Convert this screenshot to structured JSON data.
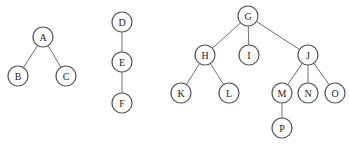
{
  "diagram": {
    "type": "forest",
    "node_radius": 10,
    "trees": [
      {
        "root": "A",
        "nodes": [
          {
            "id": "A",
            "label": "A",
            "x": 43,
            "y": 37
          },
          {
            "id": "B",
            "label": "B",
            "x": 18,
            "y": 76
          },
          {
            "id": "C",
            "label": "C",
            "x": 66,
            "y": 76
          }
        ],
        "edges": [
          [
            "A",
            "B"
          ],
          [
            "A",
            "C"
          ]
        ]
      },
      {
        "root": "D",
        "nodes": [
          {
            "id": "D",
            "label": "D",
            "x": 122,
            "y": 22
          },
          {
            "id": "E",
            "label": "E",
            "x": 122,
            "y": 62
          },
          {
            "id": "F",
            "label": "F",
            "x": 122,
            "y": 103
          }
        ],
        "edges": [
          [
            "D",
            "E"
          ],
          [
            "E",
            "F"
          ]
        ]
      },
      {
        "root": "G",
        "nodes": [
          {
            "id": "G",
            "label": "G",
            "x": 248,
            "y": 16
          },
          {
            "id": "H",
            "label": "H",
            "x": 205,
            "y": 55
          },
          {
            "id": "I",
            "label": "I",
            "x": 249,
            "y": 55
          },
          {
            "id": "J",
            "label": "J",
            "x": 308,
            "y": 55
          },
          {
            "id": "K",
            "label": "K",
            "x": 181,
            "y": 93
          },
          {
            "id": "L",
            "label": "L",
            "x": 229,
            "y": 93
          },
          {
            "id": "M",
            "label": "M",
            "x": 282,
            "y": 93
          },
          {
            "id": "N",
            "label": "N",
            "x": 308,
            "y": 93
          },
          {
            "id": "O",
            "label": "O",
            "x": 335,
            "y": 93
          },
          {
            "id": "P",
            "label": "P",
            "x": 282,
            "y": 128
          }
        ],
        "edges": [
          [
            "G",
            "H"
          ],
          [
            "G",
            "I"
          ],
          [
            "G",
            "J"
          ],
          [
            "H",
            "K"
          ],
          [
            "H",
            "L"
          ],
          [
            "J",
            "M"
          ],
          [
            "J",
            "N"
          ],
          [
            "J",
            "O"
          ],
          [
            "M",
            "P"
          ]
        ]
      }
    ]
  }
}
